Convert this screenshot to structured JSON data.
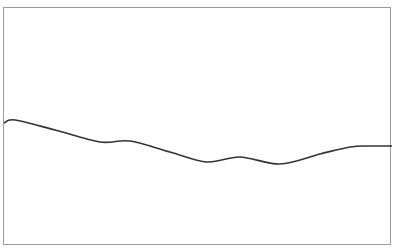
{
  "chart_data": {
    "type": "line",
    "title": "",
    "xlabel": "",
    "ylabel": "",
    "grid": false,
    "legend": null,
    "series": [
      {
        "name": "series-1",
        "color": "#333333",
        "points_px": [
          [
            4,
            123
          ],
          [
            15,
            120
          ],
          [
            55,
            130
          ],
          [
            100,
            142
          ],
          [
            130,
            141
          ],
          [
            170,
            152
          ],
          [
            207,
            162
          ],
          [
            240,
            157
          ],
          [
            280,
            164
          ],
          [
            320,
            154
          ],
          [
            350,
            147
          ],
          [
            370,
            146
          ],
          [
            392,
            146
          ]
        ]
      }
    ],
    "x": [
      0,
      1,
      2,
      3,
      4,
      5,
      6,
      7,
      8,
      9,
      10,
      11,
      12
    ],
    "values": [
      0.47,
      0.49,
      0.44,
      0.39,
      0.39,
      0.35,
      0.3,
      0.32,
      0.29,
      0.33,
      0.36,
      0.37,
      0.37
    ]
  }
}
